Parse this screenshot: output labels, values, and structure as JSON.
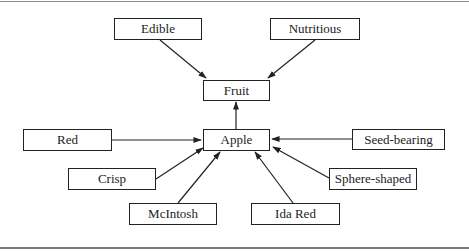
{
  "diagram": {
    "type": "concept-map",
    "nodes": [
      {
        "id": "edible",
        "label": "Edible",
        "box": [
          114,
          18,
          88,
          22
        ]
      },
      {
        "id": "nutritious",
        "label": "Nutritious",
        "box": [
          270,
          18,
          90,
          22
        ]
      },
      {
        "id": "fruit",
        "label": "Fruit",
        "box": [
          203,
          80,
          67,
          20
        ]
      },
      {
        "id": "apple",
        "label": "Apple",
        "box": [
          203,
          130,
          67,
          20
        ]
      },
      {
        "id": "red",
        "label": "Red",
        "box": [
          23,
          129,
          89,
          22
        ]
      },
      {
        "id": "seed_bearing",
        "label": "Seed-bearing",
        "box": [
          352,
          129,
          93,
          21
        ]
      },
      {
        "id": "crisp",
        "label": "Crisp",
        "box": [
          68,
          168,
          88,
          22
        ]
      },
      {
        "id": "sphere_shaped",
        "label": "Sphere-shaped",
        "box": [
          329,
          168,
          88,
          22
        ]
      },
      {
        "id": "mcintosh",
        "label": "McIntosh",
        "box": [
          129,
          203,
          88,
          22
        ]
      },
      {
        "id": "ida_red",
        "label": "Ida Red",
        "box": [
          251,
          203,
          89,
          22
        ]
      }
    ],
    "edges": [
      {
        "from": "edible",
        "to": "fruit"
      },
      {
        "from": "nutritious",
        "to": "fruit"
      },
      {
        "from": "apple",
        "to": "fruit"
      },
      {
        "from": "red",
        "to": "apple"
      },
      {
        "from": "seed_bearing",
        "to": "apple"
      },
      {
        "from": "crisp",
        "to": "apple"
      },
      {
        "from": "sphere_shaped",
        "to": "apple"
      },
      {
        "from": "mcintosh",
        "to": "apple"
      },
      {
        "from": "ida_red",
        "to": "apple"
      }
    ]
  },
  "labels": {
    "edible": "Edible",
    "nutritious": "Nutritious",
    "fruit": "Fruit",
    "apple": "Apple",
    "red": "Red",
    "seed_bearing": "Seed-bearing",
    "crisp": "Crisp",
    "sphere_shaped": "Sphere-shaped",
    "mcintosh": "McIntosh",
    "ida_red": "Ida Red"
  }
}
